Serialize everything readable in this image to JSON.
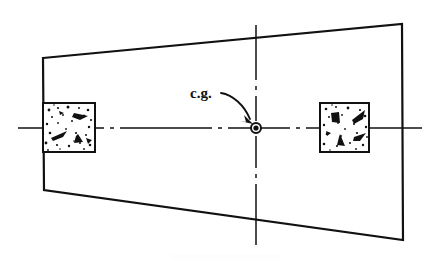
{
  "figure": {
    "domain": "Diagram",
    "kind": "engineering-plan-view-sketch",
    "background_color": "#ffffff",
    "line_color": "#111111",
    "width": 439,
    "height": 267
  },
  "labels": {
    "cg_label": "c.g.",
    "cg_label_x": 190,
    "cg_label_y": 86
  },
  "outline": {
    "name": "tapered-slab-outline",
    "description": "Trapezoidal plan outline, narrower at left, wider at right",
    "points": [
      [
        43,
        58
      ],
      [
        402,
        24
      ],
      [
        403,
        240
      ],
      [
        44,
        190
      ]
    ],
    "stroke_width": 2.2
  },
  "pads": [
    {
      "name": "left-concrete-pad",
      "x": 43,
      "y": 103,
      "width": 52,
      "height": 49,
      "hatch": "concrete-aggregate-speckle"
    },
    {
      "name": "right-concrete-pad",
      "x": 320,
      "y": 103,
      "width": 49,
      "height": 49,
      "hatch": "concrete-aggregate-speckle"
    }
  ],
  "centerlines": {
    "horizontal": {
      "name": "horizontal-centerline",
      "y": 128,
      "x_start": 18,
      "x_end": 422,
      "pattern": "dash-dot"
    },
    "vertical": {
      "name": "vertical-centerline",
      "x": 256,
      "y_start": 25,
      "y_end": 245,
      "pattern": "dash-dot"
    }
  },
  "cg_marker": {
    "name": "center-of-gravity-marker",
    "x": 256,
    "y": 128,
    "outer_radius": 5.0,
    "inner_radius": 2.6
  },
  "leader": {
    "name": "cg-leader-arrow",
    "path": "M 221 93 C 233 95 244 105 251 120",
    "arrow_tip_x": 253,
    "arrow_tip_y": 124
  },
  "speckles": {
    "left_pad": [
      {
        "cx": 49,
        "cy": 110,
        "r": 1.4
      },
      {
        "cx": 58,
        "cy": 108,
        "r": 1.1
      },
      {
        "cx": 68,
        "cy": 107,
        "r": 1.5
      },
      {
        "cx": 79,
        "cy": 108,
        "r": 1.0
      },
      {
        "cx": 88,
        "cy": 110,
        "r": 1.3
      },
      {
        "cx": 52,
        "cy": 117,
        "r": 1.0
      },
      {
        "cx": 63,
        "cy": 115,
        "r": 0.9
      },
      {
        "cx": 84,
        "cy": 116,
        "r": 1.5
      },
      {
        "cx": 91,
        "cy": 120,
        "r": 1.1
      },
      {
        "cx": 47,
        "cy": 124,
        "r": 1.2
      },
      {
        "cx": 58,
        "cy": 123,
        "r": 0.9
      },
      {
        "cx": 72,
        "cy": 121,
        "r": 1.0
      },
      {
        "cx": 89,
        "cy": 127,
        "r": 1.2
      },
      {
        "cx": 50,
        "cy": 133,
        "r": 1.3
      },
      {
        "cx": 62,
        "cy": 136,
        "r": 1.0
      },
      {
        "cx": 76,
        "cy": 133,
        "r": 1.1
      },
      {
        "cx": 86,
        "cy": 135,
        "r": 1.0
      },
      {
        "cx": 46,
        "cy": 143,
        "r": 1.4
      },
      {
        "cx": 57,
        "cy": 145,
        "r": 1.1
      },
      {
        "cx": 69,
        "cy": 146,
        "r": 1.2
      },
      {
        "cx": 80,
        "cy": 143,
        "r": 1.0
      },
      {
        "cx": 90,
        "cy": 145,
        "r": 1.3
      },
      {
        "cx": 66,
        "cy": 129,
        "r": 0.9
      },
      {
        "cx": 54,
        "cy": 105,
        "r": 0.8
      },
      {
        "cx": 74,
        "cy": 141,
        "r": 0.8
      },
      {
        "cx": 84,
        "cy": 149,
        "r": 0.9
      },
      {
        "cx": 60,
        "cy": 149,
        "r": 0.8
      },
      {
        "cx": 48,
        "cy": 150,
        "r": 0.9
      }
    ],
    "right_pad": [
      {
        "cx": 326,
        "cy": 109,
        "r": 1.3
      },
      {
        "cx": 336,
        "cy": 107,
        "r": 1.0
      },
      {
        "cx": 348,
        "cy": 108,
        "r": 1.4
      },
      {
        "cx": 360,
        "cy": 110,
        "r": 1.1
      },
      {
        "cx": 329,
        "cy": 117,
        "r": 1.0
      },
      {
        "cx": 342,
        "cy": 115,
        "r": 0.9
      },
      {
        "cx": 365,
        "cy": 116,
        "r": 1.3
      },
      {
        "cx": 324,
        "cy": 125,
        "r": 1.2
      },
      {
        "cx": 338,
        "cy": 123,
        "r": 0.9
      },
      {
        "cx": 354,
        "cy": 124,
        "r": 1.0
      },
      {
        "cx": 366,
        "cy": 127,
        "r": 1.2
      },
      {
        "cx": 327,
        "cy": 134,
        "r": 1.3
      },
      {
        "cx": 341,
        "cy": 136,
        "r": 1.0
      },
      {
        "cx": 357,
        "cy": 133,
        "r": 1.1
      },
      {
        "cx": 324,
        "cy": 144,
        "r": 1.3
      },
      {
        "cx": 337,
        "cy": 146,
        "r": 1.1
      },
      {
        "cx": 350,
        "cy": 143,
        "r": 1.0
      },
      {
        "cx": 363,
        "cy": 145,
        "r": 1.2
      },
      {
        "cx": 345,
        "cy": 129,
        "r": 0.9
      },
      {
        "cx": 332,
        "cy": 105,
        "r": 0.8
      },
      {
        "cx": 356,
        "cy": 149,
        "r": 0.9
      },
      {
        "cx": 330,
        "cy": 150,
        "r": 0.8
      },
      {
        "cx": 367,
        "cy": 137,
        "r": 0.9
      }
    ]
  },
  "aggregate_chips": {
    "left_pad": [
      {
        "points": "74,113 88,116 80,120 72,117",
        "name": "chip"
      },
      {
        "points": "51,138 67,131 63,137 53,141",
        "name": "chip"
      },
      {
        "points": "78,134 83,142 74,143 76,136",
        "name": "chip"
      },
      {
        "points": "86,138 92,140 88,144",
        "name": "chip"
      },
      {
        "points": "59,111 64,113 60,115",
        "name": "chip"
      }
    ],
    "right_pad": [
      {
        "points": "331,113 339,112 340,123 332,122",
        "name": "chip"
      },
      {
        "points": "352,120 365,110 363,119 354,124",
        "name": "chip"
      },
      {
        "points": "340,134 345,146 337,145 339,137",
        "name": "chip"
      },
      {
        "points": "354,137 366,133 360,141 353,141",
        "name": "chip"
      },
      {
        "points": "326,131 331,133 327,136",
        "name": "chip"
      }
    ]
  }
}
